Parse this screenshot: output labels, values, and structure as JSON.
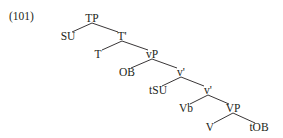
{
  "example_number": "(101)",
  "tree": {
    "nodes": [
      {
        "id": "TP",
        "label": "TP",
        "x": 92,
        "y": 12
      },
      {
        "id": "SU",
        "label": "SU",
        "x": 68,
        "y": 30
      },
      {
        "id": "Tbar",
        "label": "T'",
        "x": 122,
        "y": 30
      },
      {
        "id": "T",
        "label": "T",
        "x": 98,
        "y": 48
      },
      {
        "id": "vP",
        "label": "vP",
        "x": 152,
        "y": 48
      },
      {
        "id": "OB",
        "label": "OB",
        "x": 127,
        "y": 66
      },
      {
        "id": "vbar1",
        "label": "v'",
        "x": 181,
        "y": 66
      },
      {
        "id": "tSU",
        "label": "tSU",
        "x": 158,
        "y": 84
      },
      {
        "id": "vbar2",
        "label": "v'",
        "x": 208,
        "y": 84
      },
      {
        "id": "Vb",
        "label": "Vb",
        "x": 186,
        "y": 102
      },
      {
        "id": "VP",
        "label": "VP",
        "x": 233,
        "y": 102
      },
      {
        "id": "V",
        "label": "V",
        "x": 210,
        "y": 121
      },
      {
        "id": "tOB",
        "label": "tOB",
        "x": 259,
        "y": 121
      }
    ],
    "edges": [
      [
        "TP",
        "SU"
      ],
      [
        "TP",
        "Tbar"
      ],
      [
        "Tbar",
        "T"
      ],
      [
        "Tbar",
        "vP"
      ],
      [
        "vP",
        "OB"
      ],
      [
        "vP",
        "vbar1"
      ],
      [
        "vbar1",
        "tSU"
      ],
      [
        "vbar1",
        "vbar2"
      ],
      [
        "vbar2",
        "Vb"
      ],
      [
        "vbar2",
        "VP"
      ],
      [
        "VP",
        "V"
      ],
      [
        "VP",
        "tOB"
      ]
    ]
  }
}
